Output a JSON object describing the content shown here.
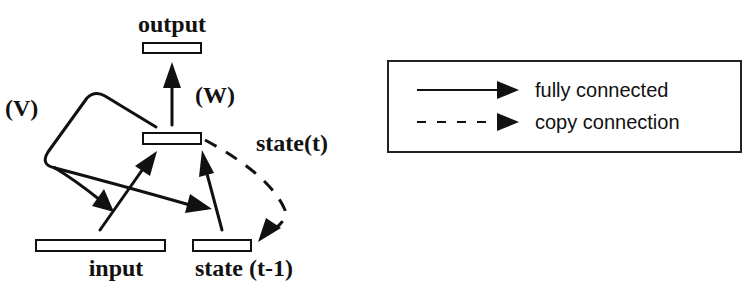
{
  "diagram": {
    "type": "simple-recurrent-network",
    "nodes": {
      "output": {
        "label": "output"
      },
      "state_t": {
        "label": "state(t)"
      },
      "input": {
        "label": "input"
      },
      "state_t_minus_1": {
        "label": "state (t-1)"
      }
    },
    "weights": {
      "W": "(W)",
      "V": "(V)"
    },
    "edges": [
      {
        "from": "state_t",
        "to": "output",
        "kind": "fully connected",
        "weight": "(W)"
      },
      {
        "from": "input",
        "to": "state_t",
        "kind": "fully connected",
        "weight": "(V)"
      },
      {
        "from": "state_t_minus_1",
        "to": "state_t",
        "kind": "fully connected",
        "weight": "(V)"
      },
      {
        "from": "state_t",
        "to": "state_t_minus_1",
        "kind": "copy connection"
      }
    ]
  },
  "legend": {
    "items": [
      {
        "label": "fully connected",
        "style": "solid"
      },
      {
        "label": "copy connection",
        "style": "dashed"
      }
    ]
  }
}
